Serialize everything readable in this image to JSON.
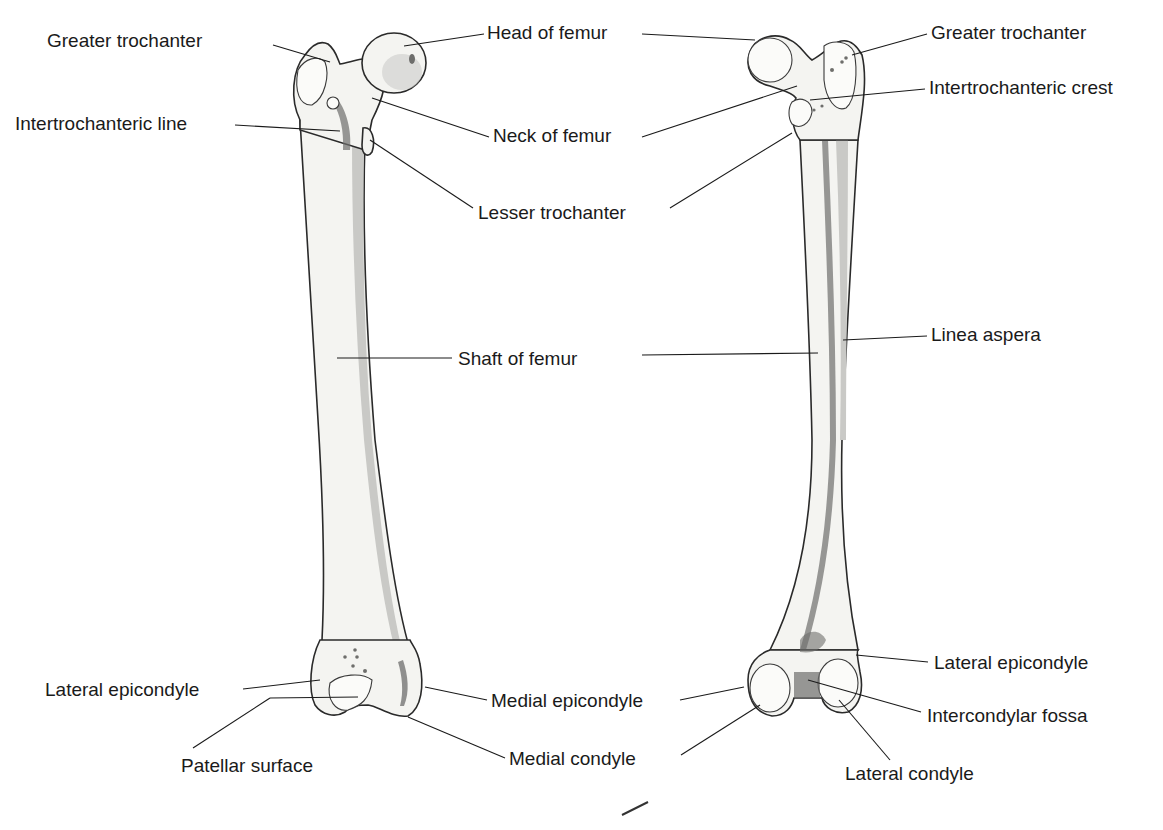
{
  "diagram": {
    "views": [
      {
        "name": "anterior",
        "labels": [
          {
            "id": "greater-trochanter-a",
            "text": "Greater trochanter",
            "x": 47,
            "y": 30
          },
          {
            "id": "intertrochanteric-line",
            "text": "Intertrochanteric line",
            "x": 15,
            "y": 113
          },
          {
            "id": "lateral-epicondyle-a",
            "text": "Lateral epicondyle",
            "x": 45,
            "y": 679
          },
          {
            "id": "patellar-surface",
            "text": "Patellar surface",
            "x": 181,
            "y": 755
          },
          {
            "id": "medial-epicondyle",
            "text": "Medial epicondyle",
            "x": 491,
            "y": 690
          },
          {
            "id": "medial-condyle",
            "text": "Medial condyle",
            "x": 509,
            "y": 748
          }
        ]
      },
      {
        "name": "posterior",
        "labels": [
          {
            "id": "greater-trochanter-p",
            "text": "Greater trochanter",
            "x": 931,
            "y": 22
          },
          {
            "id": "intertrochanteric-crest",
            "text": "Intertrochanteric crest",
            "x": 929,
            "y": 77
          },
          {
            "id": "linea-aspera",
            "text": "Linea aspera",
            "x": 931,
            "y": 324
          },
          {
            "id": "lateral-epicondyle-p",
            "text": "Lateral epicondyle",
            "x": 934,
            "y": 652
          },
          {
            "id": "intercondylar-fossa",
            "text": "Intercondylar fossa",
            "x": 927,
            "y": 705
          },
          {
            "id": "lateral-condyle",
            "text": "Lateral condyle",
            "x": 845,
            "y": 763
          }
        ]
      }
    ],
    "shared_labels": [
      {
        "id": "head-of-femur",
        "text": "Head of femur",
        "x": 487,
        "y": 22
      },
      {
        "id": "neck-of-femur",
        "text": "Neck of femur",
        "x": 493,
        "y": 125
      },
      {
        "id": "lesser-trochanter",
        "text": "Lesser trochanter",
        "x": 478,
        "y": 202
      },
      {
        "id": "shaft-of-femur",
        "text": "Shaft of femur",
        "x": 458,
        "y": 348
      }
    ],
    "colors": {
      "bone_fill": "#f4f4f1",
      "outline": "#2a2a2a",
      "shade": "#c9c9c6",
      "dark_shade": "#6e6e6c",
      "text": "#1a1a1a",
      "background": "#ffffff"
    }
  }
}
